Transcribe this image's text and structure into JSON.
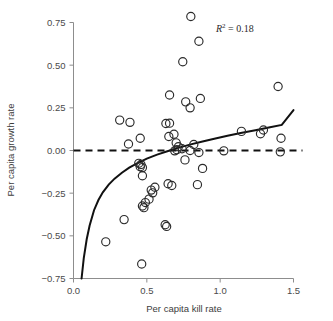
{
  "chart_data": {
    "type": "scatter",
    "title": "",
    "xlabel": "Per capita kill rate",
    "ylabel": "Per capita growth rate",
    "xlim": [
      0.0,
      1.5
    ],
    "ylim": [
      -0.75,
      0.85
    ],
    "xticks": [
      "0.0",
      "0.5",
      "1.0",
      "1.5"
    ],
    "xtick_values": [
      0.0,
      0.5,
      1.0,
      1.5
    ],
    "yticks": [
      "0.75",
      "0.50",
      "0.25",
      "0.00",
      "−0.25",
      "−0.50",
      "−0.75"
    ],
    "ytick_values": [
      0.75,
      0.5,
      0.25,
      0.0,
      -0.25,
      -0.5,
      -0.75
    ],
    "grid": false,
    "legend": "none",
    "annotations": [
      {
        "text": "R² = 0.18",
        "symbol": "R",
        "superscript": "2",
        "value": "0.18",
        "x": 1.0,
        "y": 0.7
      }
    ],
    "reference_lines": [
      {
        "name": "zero-growth-line",
        "orientation": "horizontal",
        "y": 0.0,
        "style": "dashed",
        "color": "#111111"
      }
    ],
    "fitted_curve": {
      "name": "log-fit-curve",
      "style": "solid",
      "color": "#111111",
      "points": [
        [
          0.055,
          -0.75
        ],
        [
          0.07,
          -0.63
        ],
        [
          0.09,
          -0.52
        ],
        [
          0.11,
          -0.44
        ],
        [
          0.14,
          -0.35
        ],
        [
          0.17,
          -0.29
        ],
        [
          0.2,
          -0.245
        ],
        [
          0.24,
          -0.2
        ],
        [
          0.28,
          -0.165
        ],
        [
          0.33,
          -0.13
        ],
        [
          0.38,
          -0.1
        ],
        [
          0.44,
          -0.072
        ],
        [
          0.5,
          -0.048
        ],
        [
          0.57,
          -0.024
        ],
        [
          0.64,
          -0.004
        ],
        [
          0.72,
          0.017
        ],
        [
          0.8,
          0.036
        ],
        [
          0.88,
          0.053
        ],
        [
          0.96,
          0.069
        ],
        [
          1.05,
          0.086
        ],
        [
          1.14,
          0.102
        ],
        [
          1.24,
          0.119
        ],
        [
          1.34,
          0.136
        ],
        [
          1.42,
          0.15
        ],
        [
          1.5,
          0.237
        ]
      ]
    },
    "series": [
      {
        "name": "observations",
        "marker": "open-circle",
        "color": "#2b2b2b",
        "points": [
          [
            0.8,
            0.785
          ],
          [
            0.855,
            0.64
          ],
          [
            0.745,
            0.52
          ],
          [
            1.395,
            0.375
          ],
          [
            0.655,
            0.325
          ],
          [
            0.865,
            0.305
          ],
          [
            0.765,
            0.285
          ],
          [
            0.795,
            0.25
          ],
          [
            0.315,
            0.178
          ],
          [
            0.385,
            0.165
          ],
          [
            0.63,
            0.158
          ],
          [
            0.655,
            0.16
          ],
          [
            1.295,
            0.12
          ],
          [
            1.145,
            0.112
          ],
          [
            1.275,
            0.098
          ],
          [
            0.685,
            0.095
          ],
          [
            0.65,
            0.082
          ],
          [
            0.455,
            0.072
          ],
          [
            1.415,
            0.072
          ],
          [
            0.7,
            0.045
          ],
          [
            0.375,
            0.038
          ],
          [
            0.82,
            0.035
          ],
          [
            0.715,
            0.022
          ],
          [
            0.74,
            0.01
          ],
          [
            0.705,
            0.005
          ],
          [
            0.69,
            -0.002
          ],
          [
            0.795,
            0.0
          ],
          [
            1.025,
            -0.002
          ],
          [
            1.41,
            -0.008
          ],
          [
            0.855,
            -0.012
          ],
          [
            0.76,
            -0.055
          ],
          [
            0.445,
            -0.075
          ],
          [
            0.46,
            -0.082
          ],
          [
            0.455,
            -0.095
          ],
          [
            0.47,
            -0.1
          ],
          [
            0.88,
            -0.105
          ],
          [
            0.47,
            -0.148
          ],
          [
            0.845,
            -0.2
          ],
          [
            0.645,
            -0.195
          ],
          [
            0.67,
            -0.205
          ],
          [
            0.555,
            -0.215
          ],
          [
            0.53,
            -0.232
          ],
          [
            0.54,
            -0.248
          ],
          [
            0.515,
            -0.285
          ],
          [
            0.49,
            -0.305
          ],
          [
            0.47,
            -0.325
          ],
          [
            0.48,
            -0.335
          ],
          [
            0.345,
            -0.405
          ],
          [
            0.625,
            -0.435
          ],
          [
            0.635,
            -0.445
          ],
          [
            0.22,
            -0.535
          ],
          [
            0.465,
            -0.665
          ]
        ]
      }
    ]
  },
  "axes": {
    "x_axis_name": "x-axis",
    "y_axis_name": "y-axis"
  }
}
